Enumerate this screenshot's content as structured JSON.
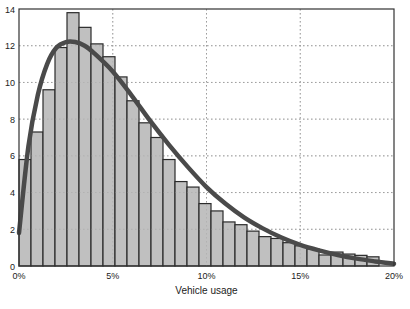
{
  "chart_data": {
    "type": "bar",
    "subtype": "histogram_with_fit_curve",
    "title": "",
    "xlabel": "Vehicle usage",
    "ylabel": "",
    "xlim": [
      0,
      20
    ],
    "ylim": [
      0,
      14
    ],
    "x_ticks": [
      0,
      5,
      10,
      15,
      20
    ],
    "x_tick_labels": [
      "0%",
      "5%",
      "10%",
      "15%",
      "20%"
    ],
    "y_ticks": [
      0,
      2,
      4,
      6,
      8,
      10,
      12,
      14
    ],
    "y_tick_labels": [
      "0",
      "2",
      "4",
      "6",
      "8",
      "10",
      "12",
      "14"
    ],
    "grid": true,
    "legend": null,
    "bin_width": 0.64,
    "values": [
      5.8,
      7.3,
      9.6,
      11.9,
      13.8,
      13.0,
      12.1,
      11.4,
      10.3,
      9.0,
      7.8,
      7.0,
      5.8,
      4.6,
      4.3,
      3.4,
      3.0,
      2.4,
      2.25,
      1.9,
      1.6,
      1.5,
      1.27,
      1.1,
      0.93,
      0.6,
      0.76,
      0.65,
      0.58,
      0.5
    ],
    "fit_curve": {
      "name": "fitted density",
      "x": [
        0,
        0.5,
        1,
        1.5,
        2,
        2.5,
        3,
        3.5,
        4,
        5,
        6,
        7,
        8,
        9,
        10,
        11,
        12,
        13,
        14,
        15,
        16,
        17,
        18,
        19,
        20
      ],
      "y": [
        1.8,
        6.5,
        9.3,
        11.0,
        11.9,
        12.2,
        12.2,
        12.0,
        11.6,
        10.6,
        9.3,
        7.9,
        6.6,
        5.4,
        4.3,
        3.4,
        2.65,
        2.05,
        1.55,
        1.15,
        0.85,
        0.6,
        0.4,
        0.25,
        0.12
      ]
    },
    "colors": {
      "bar_fill": "#c0c0c0",
      "bar_edge": "#2b2b2b",
      "curve": "#4a4a4a",
      "grid": "#888888"
    }
  }
}
